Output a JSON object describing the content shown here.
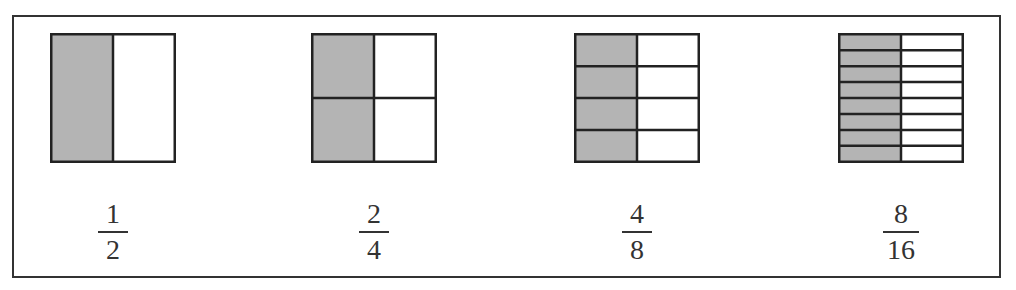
{
  "figure": {
    "caption_fragment": "g"
  },
  "colors": {
    "shade": "#b4b4b4",
    "line": "#222222",
    "background": "#ffffff"
  },
  "models": [
    {
      "rows": 1,
      "cols": 2,
      "shaded_cols": 1,
      "fraction": {
        "numerator": "1",
        "denominator": "2"
      }
    },
    {
      "rows": 2,
      "cols": 2,
      "shaded_cols": 1,
      "fraction": {
        "numerator": "2",
        "denominator": "4"
      }
    },
    {
      "rows": 4,
      "cols": 2,
      "shaded_cols": 1,
      "fraction": {
        "numerator": "4",
        "denominator": "8"
      }
    },
    {
      "rows": 8,
      "cols": 2,
      "shaded_cols": 1,
      "fraction": {
        "numerator": "8",
        "denominator": "16"
      }
    }
  ]
}
